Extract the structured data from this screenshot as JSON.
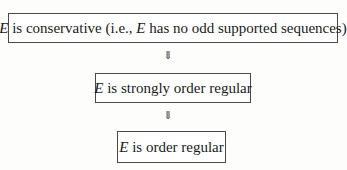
{
  "diagram": {
    "nodes": [
      {
        "var": "E",
        "text": " is conservative (i.e., ",
        "var2": "E",
        "text2": " has no odd supported sequences)"
      },
      {
        "var": "E",
        "text": " is strongly order regular"
      },
      {
        "var": "E",
        "text": " is order regular"
      }
    ],
    "arrows": [
      "⇓",
      "⇓"
    ]
  }
}
